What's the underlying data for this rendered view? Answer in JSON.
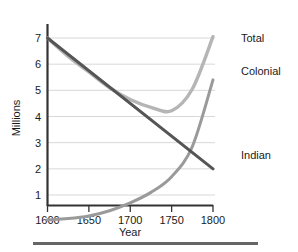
{
  "chart_data": {
    "type": "line",
    "title": "",
    "xlabel": "Year",
    "ylabel": "Millions",
    "xlim": [
      1600,
      1800
    ],
    "ylim": [
      0,
      7.3
    ],
    "grid": true,
    "legend_position": "right-inline",
    "x_ticks": [
      "1600",
      "1650",
      "1700",
      "1750",
      "1800"
    ],
    "x_tick_values": [
      1600,
      1650,
      1700,
      1750,
      1800
    ],
    "y_ticks": [
      "1",
      "2",
      "3",
      "4",
      "5",
      "6",
      "7"
    ],
    "y_tick_values": [
      1,
      2,
      3,
      4,
      5,
      6,
      7
    ],
    "x": [
      1600,
      1625,
      1650,
      1675,
      1700,
      1725,
      1750,
      1775,
      1800
    ],
    "series": [
      {
        "name": "Total",
        "color": "#b5b5b5",
        "label": "Total",
        "values": [
          7.0,
          6.3,
          5.7,
          5.1,
          4.65,
          4.35,
          4.22,
          5.05,
          7.05
        ]
      },
      {
        "name": "Colonial",
        "color": "#9a9a9a",
        "label": "Colonial",
        "values": [
          0.05,
          0.1,
          0.2,
          0.4,
          0.7,
          1.1,
          1.7,
          2.85,
          5.4
        ]
      },
      {
        "name": "Indian",
        "color": "#555555",
        "label": "Indian",
        "values": [
          7.0,
          6.38,
          5.75,
          5.13,
          4.5,
          3.88,
          3.25,
          2.63,
          2.0
        ]
      }
    ],
    "annotations": [
      {
        "name": "crossover-indian-colonial",
        "x": 1775,
        "y": 2.6
      }
    ]
  },
  "colors": {
    "axis": "#333333",
    "grid": "#d8d8d8",
    "text": "#1a1a1a",
    "total": "#b5b5b5",
    "colonial": "#9a9a9a",
    "indian": "#555555",
    "rule": "#666666",
    "background": "#ffffff"
  }
}
